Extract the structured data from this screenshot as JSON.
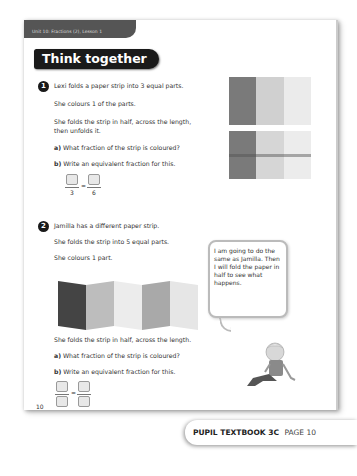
{
  "header": {
    "unit_label": "Unit 10: Fractions (2), Lesson 1",
    "section_title": "Think together"
  },
  "question1": {
    "number": "1",
    "lines": [
      "Lexi folds a paper strip into 3 equal parts.",
      "She colours 1 of the parts.",
      "She folds the strip in half, across the length,",
      "then unfolds it."
    ],
    "part_a_label": "a)",
    "part_a": "What fraction of the strip is coloured?",
    "part_b_label": "b)",
    "part_b": "Write an equivalent fraction for this.",
    "fraction_left_denominator": "3",
    "equals": "=",
    "fraction_right_denominator": "6",
    "strip_colors": [
      "#7a7a7a",
      "#cfcfcf",
      "#e9e9e9"
    ]
  },
  "question2": {
    "number": "2",
    "lines": [
      "Jamilla has a different paper strip.",
      "She folds the strip into 5 equal parts.",
      "She colours 1 part.",
      "She folds the strip in half, across the length."
    ],
    "part_a_label": "a)",
    "part_a": "What fraction of the strip is coloured?",
    "part_b_label": "b)",
    "part_b": "Write an equivalent fraction for this.",
    "equals": "=",
    "strip_colors": [
      "#444444",
      "#bdbdbd",
      "#ececec",
      "#a9a9a9",
      "#e4e4e4"
    ]
  },
  "speech_bubble": {
    "text": "I am going to do the same as Jamilla. Then I will fold the paper in half to see what happens."
  },
  "page_number": "10",
  "footer": {
    "book": "PUPIL TEXTBOOK 3C",
    "page": "PAGE 10"
  }
}
